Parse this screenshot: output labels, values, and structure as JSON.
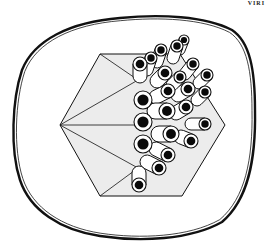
{
  "figure": {
    "corner_label": "VIRI",
    "colors": {
      "background": "#ffffff",
      "stroke": "#111111",
      "face_fill": "#ececec",
      "tube_fill": "#ffffff",
      "hole_fill": "#0a0a0a"
    },
    "envelope": {
      "path": "M 120 18 C 160 14 205 16 232 30 C 250 42 255 70 255 110 C 256 160 248 200 222 222 C 190 240 140 242 100 236 C 60 230 30 210 20 180 C 10 150 12 100 22 70 C 34 40 70 22 120 18 Z"
    },
    "hexagon": {
      "vertices": [
        [
          60,
          125
        ],
        [
          100,
          54
        ],
        [
          180,
          54
        ],
        [
          225,
          125
        ],
        [
          182,
          196
        ],
        [
          100,
          196
        ]
      ],
      "face_lines": [
        [
          [
            60,
            125
          ],
          [
            138,
            80
          ]
        ],
        [
          [
            60,
            125
          ],
          [
            138,
            168
          ]
        ],
        [
          [
            100,
            54
          ],
          [
            138,
            80
          ]
        ],
        [
          [
            100,
            196
          ],
          [
            138,
            168
          ]
        ],
        [
          [
            60,
            125
          ],
          [
            138,
            125
          ]
        ]
      ]
    },
    "capsomers": [
      {
        "x": 143,
        "y": 100,
        "r": 9,
        "dx": 0,
        "dy": 0
      },
      {
        "x": 143,
        "y": 122,
        "r": 9,
        "dx": 0,
        "dy": 0
      },
      {
        "x": 143,
        "y": 144,
        "r": 9,
        "dx": 0,
        "dy": 0
      },
      {
        "x": 140,
        "y": 64,
        "r": 7,
        "dx": 0,
        "dy": 12
      },
      {
        "x": 139,
        "y": 185,
        "r": 7,
        "dx": 0,
        "dy": -12
      },
      {
        "x": 167,
        "y": 111,
        "r": 8,
        "dx": -12,
        "dy": 0
      },
      {
        "x": 171,
        "y": 134,
        "r": 8,
        "dx": -12,
        "dy": 0
      },
      {
        "x": 168,
        "y": 155,
        "r": 7,
        "dx": -12,
        "dy": -6
      },
      {
        "x": 159,
        "y": 168,
        "r": 7,
        "dx": -12,
        "dy": -6
      },
      {
        "x": 191,
        "y": 141,
        "r": 7,
        "dx": -10,
        "dy": -4
      },
      {
        "x": 205,
        "y": 124,
        "r": 6,
        "dx": -14,
        "dy": 0
      },
      {
        "x": 168,
        "y": 91,
        "r": 7,
        "dx": -12,
        "dy": 6
      },
      {
        "x": 165,
        "y": 73,
        "r": 7,
        "dx": -8,
        "dy": 8
      },
      {
        "x": 186,
        "y": 107,
        "r": 7,
        "dx": -10,
        "dy": 6
      },
      {
        "x": 188,
        "y": 89,
        "r": 7,
        "dx": -10,
        "dy": 6
      },
      {
        "x": 180,
        "y": 77,
        "r": 6,
        "dx": -8,
        "dy": 8
      },
      {
        "x": 193,
        "y": 64,
        "r": 6,
        "dx": -8,
        "dy": 10
      },
      {
        "x": 205,
        "y": 92,
        "r": 6,
        "dx": -8,
        "dy": 8
      },
      {
        "x": 207,
        "y": 75,
        "r": 6,
        "dx": -8,
        "dy": 8
      },
      {
        "x": 177,
        "y": 46,
        "r": 6,
        "dx": -4,
        "dy": 12
      },
      {
        "x": 161,
        "y": 50,
        "r": 6,
        "dx": -4,
        "dy": 12
      },
      {
        "x": 151,
        "y": 58,
        "r": 6,
        "dx": -4,
        "dy": 12
      },
      {
        "x": 184,
        "y": 40,
        "r": 5,
        "dx": -4,
        "dy": 10
      }
    ]
  }
}
